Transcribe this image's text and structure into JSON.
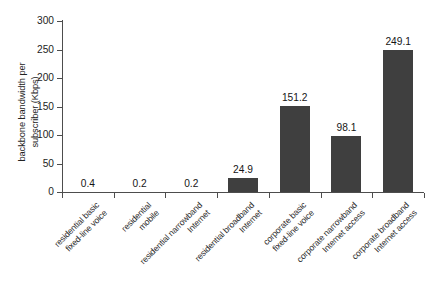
{
  "chart_data": {
    "type": "bar",
    "title": "",
    "xlabel": "",
    "ylabel": "backbone bandwidth per\nsubscriber (Kbps)",
    "ylim": [
      0,
      300
    ],
    "yticks": [
      0,
      50,
      100,
      150,
      200,
      250,
      300
    ],
    "ytick_labels": [
      "0",
      "50",
      "100",
      "150",
      "200",
      "250",
      "300"
    ],
    "grid": false,
    "legend": null,
    "bar_color": "#3f3f3f",
    "axis_color": "#4d4d4d",
    "categories": [
      "residential basic\nfixed-line voice",
      "residential\nmobile",
      "residential narrowband\nInternet",
      "residential broadband\nInternet",
      "corporate basic\nfixed-line voice",
      "corporate narrowband\nInternet access",
      "corporate broadband\nInternet access"
    ],
    "values": [
      0.4,
      0.2,
      0.2,
      24.9,
      151.2,
      98.1,
      249.1
    ],
    "value_labels": [
      "0.4",
      "0.2",
      "0.2",
      "24.9",
      "151.2",
      "98.1",
      "249.1"
    ]
  }
}
